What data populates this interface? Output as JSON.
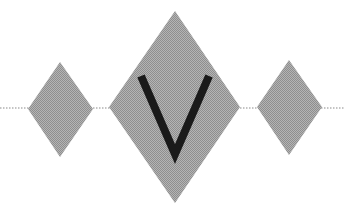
{
  "graphic": {
    "letter": "V",
    "fill_color": "#a0a0a0",
    "letter_color": "#1a1a1a",
    "line_color": "#8a8a8a",
    "shapes": [
      "diamond-small-left",
      "diamond-large-center",
      "diamond-small-right"
    ]
  }
}
